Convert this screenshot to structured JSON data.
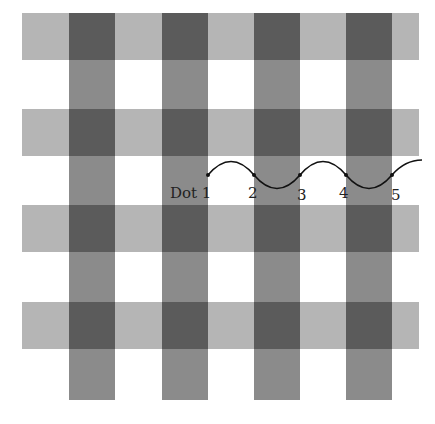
{
  "figure": {
    "colors": {
      "light_band": "#b5b5b5",
      "medium_band": "#8b8b8b",
      "intersection": "#5b5b5b",
      "background": "#ffffff",
      "line": "#111111"
    },
    "horizontal_bands_y": [
      13,
      109,
      205,
      302
    ],
    "vertical_bands_x": [
      69,
      162,
      254,
      346
    ],
    "dots": [
      {
        "label": "Dot 1",
        "x": 208,
        "y": 175
      },
      {
        "label": "2",
        "x": 254,
        "y": 175
      },
      {
        "label": "3",
        "x": 300,
        "y": 175
      },
      {
        "label": "4",
        "x": 346,
        "y": 175
      },
      {
        "label": "5",
        "x": 392,
        "y": 175
      }
    ]
  }
}
